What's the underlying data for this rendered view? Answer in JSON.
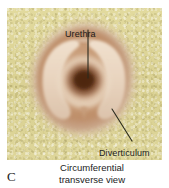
{
  "figure": {
    "panel_letter": "C",
    "caption_line1": "Circumferential",
    "caption_line2": "transverse view",
    "labels": {
      "urethra": "Urethra",
      "diverticulum": "Diverticulum"
    },
    "colors": {
      "background_plate": "#ddd598",
      "tissue_outer": "#c59a74",
      "tissue_mid": "#d8b596",
      "tissue_light": "#e8d3bd",
      "lumen_dark": "#5a2f18",
      "leader_line": "#2a2a1e",
      "text": "#1b1b1b"
    }
  }
}
